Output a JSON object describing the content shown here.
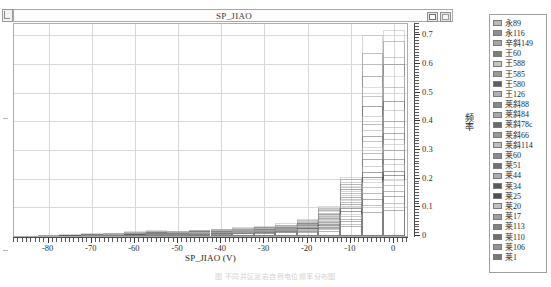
{
  "window": {
    "title": "SP_JIAO",
    "buttons": [
      {
        "name": "restore-button",
        "label": ""
      },
      {
        "name": "close-button",
        "label": ""
      }
    ]
  },
  "caption": "图   不同井区泥岩自然电位频率分布图",
  "chart_data": {
    "type": "bar",
    "title": "SP_JIAO",
    "xlabel": "SP_JIAO  (V)",
    "ylabel": "频率",
    "xlim": [
      -88,
      3
    ],
    "ylim": [
      0,
      0.74
    ],
    "xticks": [
      -80,
      -70,
      -60,
      -50,
      -40,
      -30,
      -20,
      -10,
      0
    ],
    "yticks": [
      0,
      0.1,
      0.2,
      0.3,
      0.4,
      0.5,
      0.6,
      0.7
    ],
    "ytick_labels": [
      "0",
      "0.1",
      "0.2",
      "0.3",
      "0.4",
      "0.5",
      "0.6",
      "0.7"
    ],
    "xtick_labels": [
      "-80",
      "-70",
      "-60",
      "-50",
      "-40",
      "-30",
      "-20",
      "-10",
      "0"
    ],
    "grid": true,
    "legend_position": "right",
    "bin_width": 5,
    "x": [
      -85,
      -80,
      -75,
      -70,
      -65,
      -60,
      -55,
      -50,
      -45,
      -40,
      -35,
      -30,
      -25,
      -20,
      -15,
      -10,
      -5,
      0
    ],
    "series": [
      {
        "name": "永89",
        "color": "#b9b9b9",
        "values": [
          0.0,
          0.004,
          0.006,
          0.01,
          0.012,
          0.016,
          0.02,
          0.018,
          0.022,
          0.026,
          0.03,
          0.036,
          0.044,
          0.06,
          0.105,
          0.205,
          0.7,
          0.72
        ]
      },
      {
        "name": "永116",
        "color": "#8f8f8f",
        "values": [
          0.0,
          0.003,
          0.005,
          0.008,
          0.011,
          0.014,
          0.017,
          0.016,
          0.02,
          0.024,
          0.028,
          0.033,
          0.04,
          0.055,
          0.098,
          0.198,
          0.64,
          0.68
        ]
      },
      {
        "name": "辛斜149",
        "color": "#a5a5a5",
        "values": [
          0.0,
          0.002,
          0.005,
          0.007,
          0.01,
          0.013,
          0.016,
          0.015,
          0.019,
          0.022,
          0.026,
          0.031,
          0.038,
          0.052,
          0.094,
          0.19,
          0.6,
          0.625
        ]
      },
      {
        "name": "王60",
        "color": "#7d7d7d",
        "values": [
          0.0,
          0.002,
          0.004,
          0.007,
          0.009,
          0.012,
          0.015,
          0.014,
          0.018,
          0.021,
          0.025,
          0.03,
          0.036,
          0.05,
          0.09,
          0.182,
          0.56,
          0.6
        ]
      },
      {
        "name": "王588",
        "color": "#c4c4c4",
        "values": [
          0.0,
          0.002,
          0.004,
          0.006,
          0.009,
          0.011,
          0.014,
          0.013,
          0.017,
          0.02,
          0.024,
          0.028,
          0.035,
          0.048,
          0.086,
          0.176,
          0.52,
          0.56
        ]
      },
      {
        "name": "王585",
        "color": "#9a9a9a",
        "values": [
          0.0,
          0.002,
          0.004,
          0.006,
          0.008,
          0.011,
          0.013,
          0.013,
          0.016,
          0.019,
          0.023,
          0.027,
          0.033,
          0.046,
          0.082,
          0.17,
          0.49,
          0.52
        ]
      },
      {
        "name": "王580",
        "color": "#5e5e5e",
        "values": [
          0.0,
          0.001,
          0.003,
          0.006,
          0.008,
          0.01,
          0.013,
          0.012,
          0.016,
          0.019,
          0.022,
          0.026,
          0.032,
          0.044,
          0.078,
          0.163,
          0.455,
          0.47
        ]
      },
      {
        "name": "王126",
        "color": "#b0b0b0",
        "values": [
          0.0,
          0.001,
          0.003,
          0.005,
          0.007,
          0.01,
          0.012,
          0.012,
          0.015,
          0.018,
          0.021,
          0.025,
          0.031,
          0.042,
          0.074,
          0.156,
          0.42,
          0.44
        ]
      },
      {
        "name": "莱斜88",
        "color": "#888888",
        "values": [
          0.0,
          0.001,
          0.003,
          0.005,
          0.007,
          0.009,
          0.012,
          0.011,
          0.015,
          0.017,
          0.021,
          0.024,
          0.03,
          0.041,
          0.07,
          0.15,
          0.39,
          0.4
        ]
      },
      {
        "name": "莱斜84",
        "color": "#a9a9a9",
        "values": [
          0.0,
          0.001,
          0.003,
          0.005,
          0.007,
          0.009,
          0.011,
          0.011,
          0.014,
          0.017,
          0.02,
          0.023,
          0.029,
          0.039,
          0.066,
          0.143,
          0.37,
          0.38
        ]
      },
      {
        "name": "莱斜78c",
        "color": "#6b6b6b",
        "values": [
          0.0,
          0.001,
          0.002,
          0.004,
          0.006,
          0.008,
          0.011,
          0.01,
          0.014,
          0.016,
          0.019,
          0.023,
          0.028,
          0.038,
          0.062,
          0.137,
          0.35,
          0.36
        ]
      },
      {
        "name": "莱斜66",
        "color": "#979797",
        "values": [
          0.0,
          0.001,
          0.002,
          0.004,
          0.006,
          0.008,
          0.01,
          0.01,
          0.013,
          0.015,
          0.018,
          0.022,
          0.027,
          0.036,
          0.058,
          0.13,
          0.33,
          0.34
        ]
      },
      {
        "name": "莱斜114",
        "color": "#bdbdbd",
        "values": [
          0.0,
          0.001,
          0.002,
          0.004,
          0.006,
          0.008,
          0.01,
          0.009,
          0.013,
          0.015,
          0.018,
          0.021,
          0.026,
          0.035,
          0.055,
          0.124,
          0.31,
          0.32
        ]
      },
      {
        "name": "莱60",
        "color": "#8b8b8b",
        "values": [
          0.0,
          0.001,
          0.002,
          0.004,
          0.005,
          0.007,
          0.009,
          0.009,
          0.012,
          0.014,
          0.017,
          0.02,
          0.025,
          0.033,
          0.051,
          0.118,
          0.29,
          0.3
        ]
      },
      {
        "name": "莱51",
        "color": "#707070",
        "values": [
          0.0,
          0.001,
          0.002,
          0.003,
          0.005,
          0.007,
          0.009,
          0.009,
          0.012,
          0.014,
          0.016,
          0.019,
          0.024,
          0.032,
          0.048,
          0.112,
          0.268,
          0.27
        ]
      },
      {
        "name": "莱44",
        "color": "#aeaeae",
        "values": [
          0.0,
          0.001,
          0.002,
          0.003,
          0.005,
          0.006,
          0.008,
          0.008,
          0.011,
          0.013,
          0.016,
          0.019,
          0.023,
          0.03,
          0.045,
          0.104,
          0.245,
          0.25
        ]
      },
      {
        "name": "莱34",
        "color": "#5a5a5a",
        "values": [
          0.0,
          0.001,
          0.002,
          0.003,
          0.004,
          0.006,
          0.008,
          0.008,
          0.01,
          0.012,
          0.015,
          0.018,
          0.022,
          0.029,
          0.042,
          0.096,
          0.222,
          0.228
        ]
      },
      {
        "name": "莱25",
        "color": "#4f4f4f",
        "values": [
          0.0,
          0.001,
          0.002,
          0.003,
          0.004,
          0.006,
          0.007,
          0.007,
          0.01,
          0.012,
          0.014,
          0.017,
          0.021,
          0.027,
          0.039,
          0.088,
          0.205,
          0.212
        ]
      },
      {
        "name": "莱20",
        "color": "#c0c0c0",
        "values": [
          0.0,
          0.001,
          0.001,
          0.003,
          0.004,
          0.005,
          0.007,
          0.007,
          0.009,
          0.011,
          0.014,
          0.016,
          0.02,
          0.025,
          0.036,
          0.078,
          0.188,
          0.196
        ]
      },
      {
        "name": "莱17",
        "color": "#9e9e9e",
        "values": [
          0.0,
          0.001,
          0.001,
          0.002,
          0.004,
          0.005,
          0.006,
          0.006,
          0.009,
          0.01,
          0.013,
          0.015,
          0.019,
          0.023,
          0.033,
          0.069,
          0.17,
          0.178
        ]
      },
      {
        "name": "莱113",
        "color": "#828282",
        "values": [
          0.0,
          0.0,
          0.001,
          0.002,
          0.003,
          0.005,
          0.006,
          0.006,
          0.008,
          0.01,
          0.012,
          0.014,
          0.018,
          0.021,
          0.03,
          0.06,
          0.15,
          0.158
        ]
      },
      {
        "name": "莱110",
        "color": "#6f6f6f",
        "values": [
          0.0,
          0.0,
          0.001,
          0.002,
          0.003,
          0.004,
          0.005,
          0.005,
          0.008,
          0.009,
          0.011,
          0.013,
          0.016,
          0.019,
          0.027,
          0.052,
          0.13,
          0.138
        ]
      },
      {
        "name": "莱106",
        "color": "#949494",
        "values": [
          0.0,
          0.0,
          0.001,
          0.002,
          0.003,
          0.004,
          0.005,
          0.005,
          0.007,
          0.008,
          0.01,
          0.012,
          0.015,
          0.017,
          0.023,
          0.043,
          0.108,
          0.115
        ]
      },
      {
        "name": "莱1",
        "color": "#787878",
        "values": [
          0.0,
          0.0,
          0.001,
          0.001,
          0.002,
          0.003,
          0.004,
          0.004,
          0.006,
          0.007,
          0.009,
          0.011,
          0.013,
          0.015,
          0.019,
          0.034,
          0.085,
          0.092
        ]
      }
    ]
  }
}
